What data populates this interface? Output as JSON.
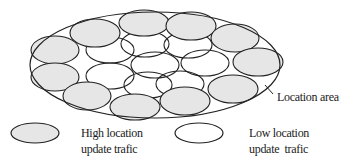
{
  "diagram": {
    "title": "",
    "outer_area": {
      "label": "Location area",
      "cx": 155,
      "cy": 65,
      "rx": 125,
      "ry": 53
    },
    "colors": {
      "high_fill": "#e6e6e6",
      "low_fill": "#ffffff",
      "stroke": "#222222"
    },
    "cells": [
      {
        "type": "low",
        "cx": 110,
        "cy": 50,
        "rx": 24,
        "ry": 13
      },
      {
        "type": "low",
        "cx": 145,
        "cy": 44,
        "rx": 24,
        "ry": 13
      },
      {
        "type": "low",
        "cx": 188,
        "cy": 45,
        "rx": 24,
        "ry": 13
      },
      {
        "type": "low",
        "cx": 110,
        "cy": 76,
        "rx": 24,
        "ry": 13
      },
      {
        "type": "low",
        "cx": 155,
        "cy": 65,
        "rx": 24,
        "ry": 13
      },
      {
        "type": "low",
        "cx": 205,
        "cy": 63,
        "rx": 24,
        "ry": 13
      },
      {
        "type": "low",
        "cx": 148,
        "cy": 85,
        "rx": 24,
        "ry": 13
      },
      {
        "type": "low",
        "cx": 180,
        "cy": 84,
        "rx": 24,
        "ry": 13
      },
      {
        "type": "high",
        "cx": 95,
        "cy": 33,
        "rx": 25,
        "ry": 14
      },
      {
        "type": "high",
        "cx": 144,
        "cy": 23,
        "rx": 25,
        "ry": 13
      },
      {
        "type": "high",
        "cx": 191,
        "cy": 26,
        "rx": 25,
        "ry": 14
      },
      {
        "type": "high",
        "cx": 235,
        "cy": 38,
        "rx": 24,
        "ry": 14
      },
      {
        "type": "high",
        "cx": 55,
        "cy": 50,
        "rx": 24,
        "ry": 14
      },
      {
        "type": "high",
        "cx": 55,
        "cy": 77,
        "rx": 24,
        "ry": 14
      },
      {
        "type": "high",
        "cx": 258,
        "cy": 62,
        "rx": 25,
        "ry": 14
      },
      {
        "type": "high",
        "cx": 233,
        "cy": 89,
        "rx": 25,
        "ry": 14
      },
      {
        "type": "high",
        "cx": 87,
        "cy": 96,
        "rx": 24,
        "ry": 14
      },
      {
        "type": "high",
        "cx": 135,
        "cy": 107,
        "rx": 25,
        "ry": 13
      },
      {
        "type": "high",
        "cx": 185,
        "cy": 101,
        "rx": 25,
        "ry": 14
      }
    ],
    "callout_label": "Location area",
    "legend": {
      "high": {
        "line1": "High location",
        "line2": "update trafic"
      },
      "low": {
        "line1": "Low location",
        "line2": "update  trafic"
      }
    }
  }
}
